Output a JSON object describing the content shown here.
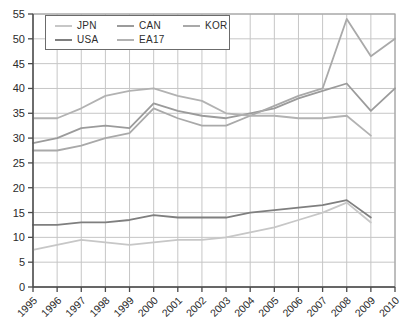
{
  "chart_data": {
    "type": "line",
    "title": "",
    "xlabel": "",
    "ylabel": "",
    "x_categories": [
      "1995",
      "1996",
      "1997",
      "1998",
      "1999",
      "2000",
      "2001",
      "2002",
      "2003",
      "2004",
      "2005",
      "2006",
      "2007",
      "2008",
      "2009",
      "2010"
    ],
    "y_ticks": [
      0,
      5,
      10,
      15,
      20,
      25,
      30,
      35,
      40,
      45,
      50,
      55
    ],
    "ylim": [
      0,
      55
    ],
    "grid": true,
    "legend_position": "top-left",
    "legend_rows": 2,
    "series": [
      {
        "name": "JPN",
        "color": "#c7c7c7",
        "values": [
          7.5,
          8.5,
          9.5,
          9,
          8.5,
          9,
          9.5,
          9.5,
          10,
          11,
          12,
          13.5,
          15,
          17,
          13,
          null
        ]
      },
      {
        "name": "CAN",
        "color": "#9b9b9b",
        "values": [
          29,
          30,
          32,
          32.5,
          32,
          37,
          35.5,
          34.5,
          34,
          35,
          36,
          38,
          39.5,
          41,
          35.5,
          40
        ]
      },
      {
        "name": "KOR",
        "color": "#a9a9a9",
        "values": [
          27.5,
          27.5,
          28.5,
          30,
          31,
          36,
          34,
          32.5,
          32.5,
          34.5,
          36.5,
          38.5,
          40,
          54,
          46.5,
          50
        ]
      },
      {
        "name": "USA",
        "color": "#7f7f7f",
        "values": [
          12.5,
          12.5,
          13,
          13,
          13.5,
          14.5,
          14,
          14,
          14,
          15,
          15.5,
          16,
          16.5,
          17.5,
          14,
          null
        ]
      },
      {
        "name": "EA17",
        "color": "#b2b2b2",
        "values": [
          34,
          34,
          36,
          38.5,
          39.5,
          40,
          38.5,
          37.5,
          35,
          34.5,
          34.5,
          34,
          34,
          34.5,
          30.5,
          null
        ]
      }
    ]
  },
  "colors": {
    "background": "#ffffff",
    "grid": "#c6c6c6",
    "plot_border": "#a6a6a6",
    "axis": "#4a4a4a",
    "tick_label": "#2b2b2b",
    "legend_border": "#6b6b6b"
  }
}
